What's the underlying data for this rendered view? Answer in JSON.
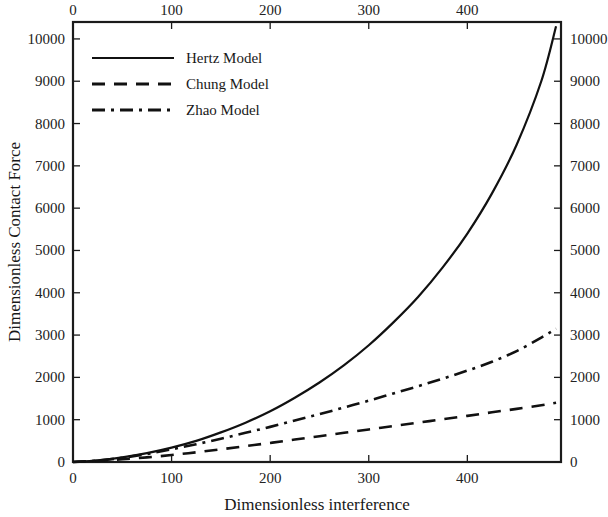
{
  "chart_data": {
    "type": "line",
    "title": "",
    "xlabel": "Dimensionless interference",
    "ylabel": "Dimensionless Contact Force",
    "xlim": [
      0,
      495
    ],
    "ylim": [
      0,
      10400
    ],
    "grid": false,
    "legend_position": "top-left",
    "x_ticks": [
      "0",
      "100",
      "200",
      "300",
      "400"
    ],
    "x_tick_values": [
      0,
      100,
      200,
      300,
      400
    ],
    "y_ticks": [
      "0",
      "1000",
      "2000",
      "3000",
      "4000",
      "5000",
      "6000",
      "7000",
      "8000",
      "9000",
      "10000"
    ],
    "y_tick_values": [
      0,
      1000,
      2000,
      3000,
      4000,
      5000,
      6000,
      7000,
      8000,
      9000,
      10000
    ],
    "top_axis_ticks": [
      "0",
      "100",
      "200",
      "300",
      "400"
    ],
    "right_axis_ticks": [
      "0",
      "1000",
      "2000",
      "3000",
      "4000",
      "5000",
      "6000",
      "7000",
      "8000",
      "9000",
      "10000"
    ],
    "x": [
      0,
      25,
      50,
      75,
      100,
      125,
      150,
      175,
      200,
      225,
      250,
      275,
      300,
      325,
      350,
      375,
      400,
      425,
      450,
      475,
      490
    ],
    "series": [
      {
        "name": "Hertz Model",
        "style": "solid",
        "values": [
          0,
          40,
          110,
          210,
          340,
          500,
          700,
          930,
          1200,
          1520,
          1880,
          2290,
          2760,
          3300,
          3900,
          4600,
          5400,
          6350,
          7500,
          9000,
          10300
        ]
      },
      {
        "name": "Chung Model",
        "style": "dashed",
        "values": [
          0,
          25,
          65,
          110,
          165,
          230,
          300,
          375,
          450,
          530,
          610,
          690,
          770,
          850,
          930,
          1010,
          1090,
          1175,
          1255,
          1340,
          1400
        ]
      },
      {
        "name": "Zhao Model",
        "style": "dashdot",
        "values": [
          0,
          35,
          100,
          190,
          300,
          420,
          550,
          690,
          830,
          980,
          1130,
          1290,
          1450,
          1620,
          1790,
          1970,
          2160,
          2370,
          2620,
          2940,
          3150
        ]
      }
    ]
  },
  "legend": {
    "entries": [
      {
        "label": "Hertz Model",
        "style": "solid"
      },
      {
        "label": "Chung Model",
        "style": "dashed"
      },
      {
        "label": "Zhao Model",
        "style": "dashdot"
      }
    ]
  },
  "colors": {
    "line": "#111111",
    "axis": "#1b1b1b",
    "background": "#ffffff",
    "text": "#181818"
  }
}
